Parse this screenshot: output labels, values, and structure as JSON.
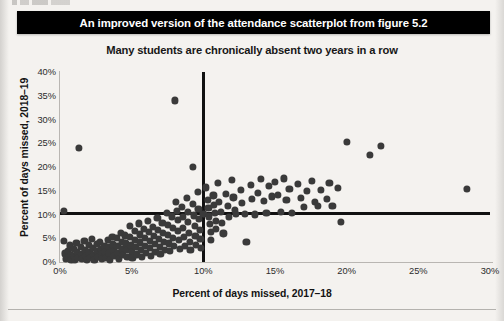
{
  "banner": {
    "text": "An improved version of the attendance scatterplot from figure 5.2"
  },
  "chart_data": {
    "type": "scatter",
    "title": "Many students are chronically absent two years in a row",
    "xlabel": "Percent of days missed, 2017–18",
    "ylabel": "Percent of days missed, 2018–19",
    "xlim": [
      0,
      30
    ],
    "ylim": [
      0,
      40
    ],
    "xticks": [
      "0%",
      "5%",
      "10%",
      "15%",
      "20%",
      "25%",
      "30%"
    ],
    "xtick_values": [
      0,
      5,
      10,
      15,
      20,
      25,
      30
    ],
    "yticks": [
      "0%",
      "5%",
      "10%",
      "15%",
      "20%",
      "25%",
      "30%",
      "35%",
      "40%"
    ],
    "ytick_values": [
      0,
      5,
      10,
      15,
      20,
      25,
      30,
      35,
      40
    ],
    "grid": false,
    "legend": null,
    "point_color": "#3a3a3a",
    "reference_lines": [
      {
        "name": "chronic-absence-threshold-2018-19",
        "orientation": "horizontal",
        "value": 10,
        "label": "10%",
        "color": "#111111"
      },
      {
        "name": "chronic-absence-threshold-2017-18",
        "orientation": "vertical",
        "value": 10,
        "label": "10%",
        "color": "#111111"
      }
    ],
    "points": [
      [
        0.25,
        10.6
      ],
      [
        0.3,
        4.3
      ],
      [
        0.35,
        1.6
      ],
      [
        0.4,
        0.4
      ],
      [
        0.55,
        2.2
      ],
      [
        0.6,
        0.6
      ],
      [
        0.7,
        3.3
      ],
      [
        0.75,
        1.2
      ],
      [
        0.8,
        0.3
      ],
      [
        0.95,
        2.6
      ],
      [
        1.0,
        1.0
      ],
      [
        1.05,
        0.2
      ],
      [
        1.15,
        3.8
      ],
      [
        1.2,
        2.0
      ],
      [
        1.25,
        0.7
      ],
      [
        1.3,
        23.8
      ],
      [
        1.45,
        3.0
      ],
      [
        1.5,
        1.5
      ],
      [
        1.55,
        0.4
      ],
      [
        1.7,
        4.2
      ],
      [
        1.75,
        2.4
      ],
      [
        1.8,
        1.1
      ],
      [
        1.85,
        0.3
      ],
      [
        2.0,
        3.4
      ],
      [
        2.05,
        1.8
      ],
      [
        2.1,
        0.6
      ],
      [
        2.25,
        4.6
      ],
      [
        2.3,
        2.8
      ],
      [
        2.35,
        1.3
      ],
      [
        2.4,
        0.2
      ],
      [
        2.55,
        3.6
      ],
      [
        2.6,
        2.1
      ],
      [
        2.65,
        0.9
      ],
      [
        2.8,
        4.0
      ],
      [
        2.85,
        2.5
      ],
      [
        2.9,
        1.4
      ],
      [
        2.95,
        0.4
      ],
      [
        3.1,
        3.2
      ],
      [
        3.15,
        1.9
      ],
      [
        3.2,
        0.7
      ],
      [
        3.35,
        4.4
      ],
      [
        3.4,
        2.9
      ],
      [
        3.45,
        1.6
      ],
      [
        3.5,
        0.3
      ],
      [
        3.65,
        5.1
      ],
      [
        3.7,
        3.5
      ],
      [
        3.75,
        2.2
      ],
      [
        3.8,
        1.0
      ],
      [
        3.95,
        4.8
      ],
      [
        4.0,
        3.1
      ],
      [
        4.05,
        1.7
      ],
      [
        4.1,
        0.5
      ],
      [
        4.25,
        6.0
      ],
      [
        4.3,
        4.1
      ],
      [
        4.35,
        2.6
      ],
      [
        4.4,
        1.2
      ],
      [
        4.55,
        5.4
      ],
      [
        4.6,
        3.7
      ],
      [
        4.65,
        2.3
      ],
      [
        4.7,
        0.8
      ],
      [
        4.85,
        7.4
      ],
      [
        4.9,
        5.0
      ],
      [
        4.95,
        3.3
      ],
      [
        5.0,
        1.9
      ],
      [
        5.05,
        0.6
      ],
      [
        5.2,
        6.4
      ],
      [
        5.25,
        4.5
      ],
      [
        5.3,
        2.9
      ],
      [
        5.35,
        1.4
      ],
      [
        5.5,
        7.9
      ],
      [
        5.55,
        5.6
      ],
      [
        5.6,
        3.9
      ],
      [
        5.65,
        2.4
      ],
      [
        5.7,
        0.9
      ],
      [
        5.85,
        6.8
      ],
      [
        5.9,
        4.9
      ],
      [
        5.95,
        3.2
      ],
      [
        6.0,
        1.7
      ],
      [
        6.15,
        8.4
      ],
      [
        6.2,
        6.1
      ],
      [
        6.25,
        4.3
      ],
      [
        6.3,
        2.7
      ],
      [
        6.35,
        1.1
      ],
      [
        6.5,
        7.2
      ],
      [
        6.55,
        5.3
      ],
      [
        6.6,
        3.6
      ],
      [
        6.65,
        2.0
      ],
      [
        6.8,
        9.0
      ],
      [
        6.85,
        6.6
      ],
      [
        6.9,
        4.7
      ],
      [
        6.95,
        3.0
      ],
      [
        7.0,
        1.5
      ],
      [
        7.15,
        8.0
      ],
      [
        7.2,
        5.9
      ],
      [
        7.25,
        4.0
      ],
      [
        7.3,
        2.3
      ],
      [
        7.45,
        10.2
      ],
      [
        7.5,
        7.6
      ],
      [
        7.55,
        5.5
      ],
      [
        7.6,
        3.7
      ],
      [
        7.65,
        2.1
      ],
      [
        7.8,
        9.4
      ],
      [
        7.85,
        6.9
      ],
      [
        7.9,
        4.8
      ],
      [
        7.95,
        3.1
      ],
      [
        8.0,
        33.8
      ],
      [
        8.1,
        12.5
      ],
      [
        8.15,
        10.6
      ],
      [
        8.2,
        8.6
      ],
      [
        8.25,
        6.3
      ],
      [
        8.3,
        4.4
      ],
      [
        8.35,
        2.6
      ],
      [
        8.5,
        11.4
      ],
      [
        8.55,
        9.2
      ],
      [
        8.6,
        7.0
      ],
      [
        8.65,
        5.0
      ],
      [
        8.7,
        3.2
      ],
      [
        8.85,
        13.2
      ],
      [
        8.9,
        10.4
      ],
      [
        8.95,
        8.2
      ],
      [
        9.0,
        6.0
      ],
      [
        9.05,
        4.1
      ],
      [
        9.1,
        2.4
      ],
      [
        9.25,
        19.8
      ],
      [
        9.3,
        12.0
      ],
      [
        9.35,
        9.6
      ],
      [
        9.4,
        7.4
      ],
      [
        9.45,
        5.2
      ],
      [
        9.5,
        3.4
      ],
      [
        9.6,
        14.6
      ],
      [
        9.65,
        11.0
      ],
      [
        9.7,
        8.8
      ],
      [
        9.75,
        6.5
      ],
      [
        9.8,
        4.6
      ],
      [
        9.85,
        2.8
      ],
      [
        10.0,
        10.0
      ],
      [
        10.2,
        15.5
      ],
      [
        10.3,
        12.8
      ],
      [
        10.35,
        11.2
      ],
      [
        10.4,
        9.4
      ],
      [
        10.45,
        7.8
      ],
      [
        10.5,
        6.2
      ],
      [
        10.55,
        4.5
      ],
      [
        10.7,
        13.8
      ],
      [
        10.75,
        11.8
      ],
      [
        10.8,
        10.1
      ],
      [
        10.85,
        8.4
      ],
      [
        10.9,
        6.7
      ],
      [
        11.0,
        16.4
      ],
      [
        11.1,
        12.4
      ],
      [
        11.2,
        10.3
      ],
      [
        11.3,
        8.0
      ],
      [
        11.4,
        5.8
      ],
      [
        11.6,
        14.2
      ],
      [
        11.7,
        11.6
      ],
      [
        11.8,
        9.2
      ],
      [
        12.0,
        17.0
      ],
      [
        12.1,
        13.4
      ],
      [
        12.2,
        10.8
      ],
      [
        12.3,
        9.9
      ],
      [
        12.6,
        15.0
      ],
      [
        12.7,
        12.2
      ],
      [
        12.9,
        10.0
      ],
      [
        13.0,
        4.0
      ],
      [
        13.3,
        16.0
      ],
      [
        13.4,
        13.0
      ],
      [
        13.6,
        9.8
      ],
      [
        13.8,
        14.4
      ],
      [
        14.0,
        17.2
      ],
      [
        14.2,
        12.6
      ],
      [
        14.4,
        10.2
      ],
      [
        14.6,
        15.8
      ],
      [
        14.8,
        13.6
      ],
      [
        15.0,
        16.6
      ],
      [
        15.2,
        14.0
      ],
      [
        15.4,
        10.4
      ],
      [
        15.6,
        17.4
      ],
      [
        15.8,
        12.8
      ],
      [
        16.0,
        15.2
      ],
      [
        16.2,
        10.2
      ],
      [
        16.6,
        16.2
      ],
      [
        16.8,
        13.2
      ],
      [
        17.0,
        11.4
      ],
      [
        17.2,
        14.8
      ],
      [
        17.6,
        16.8
      ],
      [
        17.8,
        12.4
      ],
      [
        18.0,
        11.6
      ],
      [
        18.2,
        15.0
      ],
      [
        18.6,
        13.0
      ],
      [
        18.8,
        16.4
      ],
      [
        19.0,
        11.6
      ],
      [
        19.4,
        15.4
      ],
      [
        19.6,
        8.2
      ],
      [
        20.0,
        25.0
      ],
      [
        21.6,
        22.4
      ],
      [
        22.4,
        24.2
      ],
      [
        28.4,
        15.2
      ]
    ]
  },
  "page": {
    "bottom_rule": true
  }
}
